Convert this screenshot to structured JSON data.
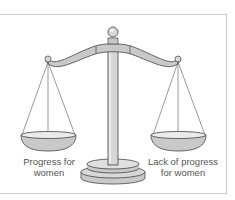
{
  "figure": {
    "left_pan": {
      "label_line1": "Progress for",
      "label_line2": "women"
    },
    "right_pan": {
      "label_line1": "Lack of progress",
      "label_line2": "for women"
    },
    "colors": {
      "metal_fill": "#c9c9c9",
      "metal_light": "#e4e4e4",
      "outline": "#444444",
      "text": "#555555",
      "frame_border": "#c8c8c8"
    }
  }
}
